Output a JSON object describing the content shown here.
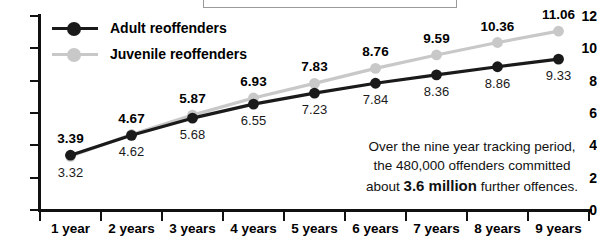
{
  "chart_data": {
    "type": "line",
    "title": "",
    "xlabel": "",
    "ylabel": "",
    "ylim": [
      0,
      12
    ],
    "yticks": [
      12,
      10,
      8,
      6,
      4,
      2,
      0
    ],
    "grid": false,
    "legend_position": "top-left",
    "categories": [
      "1 year",
      "2 years",
      "3 years",
      "4 years",
      "5 years",
      "6 years",
      "7 years",
      "8 years",
      "9 years"
    ],
    "series": [
      {
        "name": "Adult reoffenders",
        "color": "#1a1a1a",
        "values": [
          3.39,
          4.62,
          5.68,
          6.55,
          7.23,
          7.84,
          8.36,
          8.86,
          9.33
        ],
        "labels": [
          "3.39",
          "4.62",
          "5.68",
          "6.55",
          "7.23",
          "7.84",
          "8.36",
          "8.86",
          "9.33"
        ]
      },
      {
        "name": "Juvenile reoffenders",
        "color": "#c8c8c8",
        "values": [
          3.32,
          4.67,
          5.87,
          6.93,
          7.83,
          8.76,
          9.59,
          10.36,
          11.06
        ],
        "labels": [
          "3.32",
          "4.67",
          "5.87",
          "6.93",
          "7.83",
          "8.76",
          "9.59",
          "10.36",
          "11.06"
        ]
      }
    ],
    "annotation": {
      "line1": "Over the nine year tracking period,",
      "line2": "the 480,000 offenders committed",
      "line3_before": "about ",
      "line3_strong": "3.6 million",
      "line3_after": " further offences."
    }
  },
  "legend": {
    "items": [
      {
        "label": "Adult reoffenders",
        "color": "#1a1a1a"
      },
      {
        "label": "Juvenile reoffenders",
        "color": "#c8c8c8"
      }
    ]
  },
  "axis": {
    "y_labels": [
      "12",
      "10",
      "8",
      "6",
      "4",
      "2",
      "0"
    ],
    "x_labels": [
      "1 year",
      "2 years",
      "3 years",
      "4 years",
      "5 years",
      "6 years",
      "7 years",
      "8 years",
      "9 years"
    ]
  }
}
